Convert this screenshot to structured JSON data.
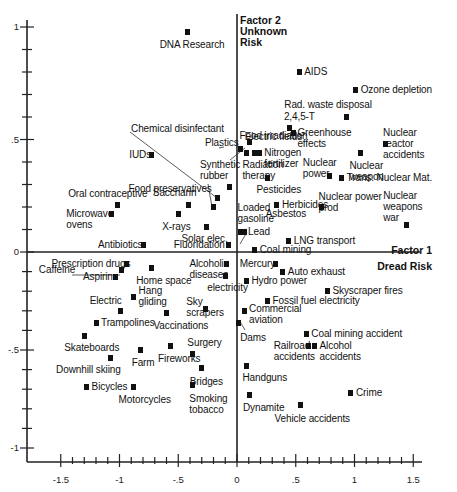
{
  "chart_data": {
    "type": "scatter",
    "title": "",
    "xlabel": "Factor 1\nDread Risk",
    "ylabel": "Factor 2\nUnknown\nRisk",
    "xlim": [
      -1.75,
      1.6
    ],
    "ylim": [
      -1.1,
      1.05
    ],
    "x_ticks": [
      "-1.5",
      "-1",
      "-.5",
      "0",
      ".5",
      "1",
      "1.5"
    ],
    "y_ticks": [
      "1",
      ".5",
      "0",
      "-.5",
      "-1"
    ],
    "grid": false,
    "points": [
      {
        "name": "DNA Research",
        "x": -0.42,
        "y": 0.98
      },
      {
        "name": "AIDS",
        "x": 0.53,
        "y": 0.8
      },
      {
        "name": "Ozone depletion",
        "x": 1.01,
        "y": 0.72
      },
      {
        "name": "Rad. waste disposal",
        "x": 0.93,
        "y": 0.6
      },
      {
        "name": "2,4,5-T",
        "x": 0.45,
        "y": 0.55
      },
      {
        "name": "Greenhouse effects",
        "x": 0.48,
        "y": 0.53
      },
      {
        "name": "Nuclear reactor accidents",
        "x": 1.26,
        "y": 0.48
      },
      {
        "name": "Nuclear weapon",
        "x": 1.05,
        "y": 0.44
      },
      {
        "name": "Food irradiation",
        "x": 0.03,
        "y": 0.46
      },
      {
        "name": "Electric fields",
        "x": 0.15,
        "y": 0.44
      },
      {
        "name": "Nitrogen fertilizer",
        "x": 0.19,
        "y": 0.44
      },
      {
        "name": "Radiation therapy",
        "x": 0.08,
        "y": 0.44
      },
      {
        "name": "Plastics",
        "x": 0.11,
        "y": 0.49
      },
      {
        "name": "Nuclear power",
        "x": 0.79,
        "y": 0.34
      },
      {
        "name": "Trans. Nuclear Mat.",
        "x": 0.89,
        "y": 0.33
      },
      {
        "name": "Pesticides",
        "x": 0.26,
        "y": 0.33
      },
      {
        "name": "Synthetic rubber",
        "x": -0.06,
        "y": 0.29
      },
      {
        "name": "Chemical disinfectant",
        "x": -0.17,
        "y": 0.24
      },
      {
        "name": "Food preservatives",
        "x": -0.2,
        "y": 0.2
      },
      {
        "name": "IUDs",
        "x": -0.73,
        "y": 0.43
      },
      {
        "name": "Saccharin",
        "x": -0.41,
        "y": 0.21
      },
      {
        "name": "X-rays",
        "x": -0.5,
        "y": 0.17
      },
      {
        "name": "Solar elec.",
        "x": -0.26,
        "y": 0.11
      },
      {
        "name": "Oral contraceptive",
        "x": -1.02,
        "y": 0.21
      },
      {
        "name": "Microwave ovens",
        "x": -1.07,
        "y": 0.17
      },
      {
        "name": "Herbicides",
        "x": 0.34,
        "y": 0.21
      },
      {
        "name": "Nuclear power prod",
        "x": 0.72,
        "y": 0.2
      },
      {
        "name": "Nuclear weapons war",
        "x": 1.44,
        "y": 0.12
      },
      {
        "name": "Asbestos",
        "x": 0.5,
        "y": 0.17
      },
      {
        "name": "Loaded gasoline",
        "x": 0.03,
        "y": 0.09
      },
      {
        "name": "Lead",
        "x": 0.06,
        "y": 0.09
      },
      {
        "name": "LNG transport",
        "x": 0.44,
        "y": 0.05
      },
      {
        "name": "Coal mining",
        "x": 0.15,
        "y": 0.01
      },
      {
        "name": "Fluoridation",
        "x": -0.07,
        "y": 0.03
      },
      {
        "name": "Antibiotics",
        "x": -0.8,
        "y": 0.03
      },
      {
        "name": "Alcoholic diseases",
        "x": -0.09,
        "y": -0.06
      },
      {
        "name": "Mercury",
        "x": 0.33,
        "y": -0.06
      },
      {
        "name": "Auto exhaust",
        "x": 0.39,
        "y": -0.1
      },
      {
        "name": "Prescription drugs",
        "x": -0.94,
        "y": -0.06
      },
      {
        "name": "Caffeine",
        "x": -0.98,
        "y": -0.09
      },
      {
        "name": "Aspirin",
        "x": -1.03,
        "y": -0.13
      },
      {
        "name": "Home space",
        "x": -0.73,
        "y": -0.08
      },
      {
        "name": "electricity",
        "x": -0.1,
        "y": -0.12
      },
      {
        "name": "Hydro power",
        "x": 0.08,
        "y": -0.15
      },
      {
        "name": "Skyscraper fires",
        "x": 0.77,
        "y": -0.2
      },
      {
        "name": "Fossil fuel electricity",
        "x": 0.26,
        "y": -0.25
      },
      {
        "name": "Hang gliding",
        "x": -0.88,
        "y": -0.23
      },
      {
        "name": "Electric",
        "x": -0.99,
        "y": -0.3
      },
      {
        "name": "Sky scrapers",
        "x": -0.27,
        "y": -0.29
      },
      {
        "name": "Commercial aviation",
        "x": 0.06,
        "y": -0.3
      },
      {
        "name": "Dams",
        "x": 0.01,
        "y": -0.36
      },
      {
        "name": "Trampolines",
        "x": -1.2,
        "y": -0.36
      },
      {
        "name": "Vaccinations",
        "x": -0.6,
        "y": -0.31
      },
      {
        "name": "Surgery",
        "x": -0.38,
        "y": -0.52
      },
      {
        "name": "Coal mining accident",
        "x": 0.59,
        "y": -0.42
      },
      {
        "name": "Railroad accidents",
        "x": 0.61,
        "y": -0.48
      },
      {
        "name": "Alcohol accidents",
        "x": 0.66,
        "y": -0.48
      },
      {
        "name": "Skateboards",
        "x": -1.3,
        "y": -0.43
      },
      {
        "name": "Farm",
        "x": -0.82,
        "y": -0.5
      },
      {
        "name": "Fireworks",
        "x": -0.57,
        "y": -0.48
      },
      {
        "name": "Downhill skiing",
        "x": -1.08,
        "y": -0.54
      },
      {
        "name": "Bridges",
        "x": -0.3,
        "y": -0.59
      },
      {
        "name": "Handguns",
        "x": 0.08,
        "y": -0.58
      },
      {
        "name": "Bicycles",
        "x": -1.28,
        "y": -0.69
      },
      {
        "name": "Motorcycles",
        "x": -0.88,
        "y": -0.69
      },
      {
        "name": "Smoking tobacco",
        "x": -0.38,
        "y": -0.68
      },
      {
        "name": "Dynamite",
        "x": 0.11,
        "y": -0.73
      },
      {
        "name": "Crime",
        "x": 0.97,
        "y": -0.72
      },
      {
        "name": "Vehicle accidents",
        "x": 0.54,
        "y": -0.78
      }
    ]
  }
}
